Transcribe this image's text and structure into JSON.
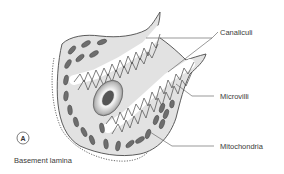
{
  "figure": {
    "panel_label": "A",
    "labels": {
      "canaliculi": "Canaliculi",
      "microvilli": "Microvilli",
      "mitochondria": "Mitochondria",
      "basement_lamina": "Basement lamina"
    },
    "colors": {
      "cytoplasm": "#e2e2e2",
      "outline": "#4a4a4a",
      "mitochondria": "#6e6e6e",
      "nucleus_outer": "#d8d8d8",
      "nucleolus": "#555555",
      "leader_line": "#555555"
    }
  }
}
